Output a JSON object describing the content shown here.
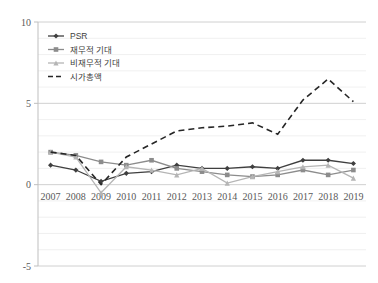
{
  "chart_data": {
    "type": "line",
    "title": "",
    "xlabel": "",
    "ylabel": "",
    "categories": [
      "2007",
      "2008",
      "2009",
      "2010",
      "2011",
      "2012",
      "2013",
      "2014",
      "2015",
      "2016",
      "2017",
      "2018",
      "2019"
    ],
    "ylim": [
      -5,
      10
    ],
    "yticks": [
      -5,
      0,
      5,
      10
    ],
    "ytick_labels": [
      "-5",
      "0",
      "5",
      "10"
    ],
    "grid": true,
    "legend_position": "top-left",
    "series": [
      {
        "name": "PSR",
        "marker": "diamond",
        "color": "#3f3f3f",
        "dash": false,
        "values": [
          1.2,
          0.9,
          0.2,
          0.7,
          0.8,
          1.2,
          1.0,
          1.0,
          1.1,
          1.0,
          1.5,
          1.5,
          1.3
        ]
      },
      {
        "name": "재무적 기대",
        "marker": "square",
        "color": "#8c8c8c",
        "dash": false,
        "values": [
          2.0,
          1.8,
          1.4,
          1.2,
          1.5,
          1.0,
          0.8,
          0.6,
          0.5,
          0.6,
          0.9,
          0.6,
          0.9
        ]
      },
      {
        "name": "비재무적 기대",
        "marker": "triangle",
        "color": "#b5b5b5",
        "dash": false,
        "values": [
          2.0,
          1.7,
          -0.5,
          1.1,
          0.9,
          0.6,
          1.0,
          0.1,
          0.5,
          0.8,
          1.1,
          1.2,
          0.4
        ]
      },
      {
        "name": "시가총액",
        "marker": "none",
        "color": "#262626",
        "dash": true,
        "values": [
          2.0,
          1.8,
          0.0,
          1.7,
          2.5,
          3.3,
          3.5,
          3.6,
          3.8,
          3.1,
          5.2,
          6.5,
          5.1
        ]
      }
    ]
  },
  "legend": {
    "items": [
      {
        "label": "PSR"
      },
      {
        "label": "재무적 기대"
      },
      {
        "label": "비재무적 기대"
      },
      {
        "label": "시가총액"
      }
    ]
  }
}
